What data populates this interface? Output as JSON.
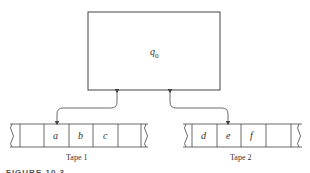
{
  "diagram": {
    "control_unit": {
      "state_label": "q",
      "state_subscript": "0"
    },
    "tapes": [
      {
        "label": "Tape 1",
        "cells": [
          "",
          "a",
          "b",
          "c",
          ""
        ]
      },
      {
        "label": "Tape 2",
        "cells": [
          "d",
          "e",
          "f",
          ""
        ]
      }
    ],
    "caption": "FIGURE 10.3"
  },
  "colors": {
    "stroke": "#444444",
    "text": "#333333"
  }
}
